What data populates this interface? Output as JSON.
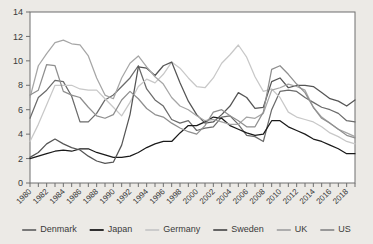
{
  "chart_data": {
    "type": "line",
    "title": "",
    "subtitle": "",
    "xlabel": "",
    "ylabel": "",
    "xlim": [
      1980,
      2019
    ],
    "ylim": [
      0,
      14
    ],
    "ytick_step": 2,
    "yticks": [
      0,
      2,
      4,
      6,
      8,
      10,
      12,
      14
    ],
    "xticks": [
      1980,
      1982,
      1984,
      1986,
      1988,
      1990,
      1992,
      1994,
      1996,
      1998,
      2000,
      2002,
      2004,
      2006,
      2008,
      2010,
      2012,
      2014,
      2016,
      2018
    ],
    "xtick_labels": [
      "1980",
      "1982",
      "1984",
      "1986",
      "1988",
      "1990",
      "1992",
      "1994",
      "1996",
      "1998",
      "2000",
      "2002",
      "2004",
      "2006",
      "2008",
      "2010",
      "2012",
      "2014",
      "2016",
      "2018"
    ],
    "x": [
      1980,
      1981,
      1982,
      1983,
      1984,
      1985,
      1986,
      1987,
      1988,
      1989,
      1990,
      1991,
      1992,
      1993,
      1994,
      1995,
      1996,
      1997,
      1998,
      1999,
      2000,
      2001,
      2002,
      2003,
      2004,
      2005,
      2006,
      2007,
      2008,
      2009,
      2010,
      2011,
      2012,
      2013,
      2014,
      2015,
      2016,
      2017,
      2018,
      2019
    ],
    "grid": true,
    "legend_position": "bottom",
    "series": [
      {
        "name": "Denmark",
        "color": "#6b6b6b",
        "values": [
          5.3,
          7.0,
          7.6,
          8.4,
          8.3,
          7.1,
          5.0,
          5.0,
          5.7,
          6.8,
          7.2,
          7.9,
          8.6,
          9.6,
          7.7,
          6.8,
          6.3,
          5.2,
          4.9,
          5.1,
          4.3,
          4.5,
          4.6,
          5.4,
          5.5,
          4.8,
          3.9,
          3.8,
          3.4,
          6.0,
          7.5,
          7.6,
          7.5,
          7.0,
          6.6,
          6.2,
          6.0,
          5.7,
          5.1,
          5.0
        ]
      },
      {
        "name": "Japan",
        "color": "#1a1a1a",
        "values": [
          2.0,
          2.2,
          2.4,
          2.6,
          2.7,
          2.6,
          2.8,
          2.8,
          2.5,
          2.3,
          2.1,
          2.1,
          2.2,
          2.5,
          2.9,
          3.2,
          3.4,
          3.4,
          4.1,
          4.7,
          4.7,
          5.0,
          5.4,
          5.3,
          4.7,
          4.4,
          4.1,
          3.9,
          4.0,
          5.1,
          5.1,
          4.6,
          4.3,
          4.0,
          3.6,
          3.4,
          3.1,
          2.8,
          2.4,
          2.4
        ]
      },
      {
        "name": "Germany",
        "color": "#c8c8c8",
        "values": [
          3.4,
          4.8,
          6.4,
          8.0,
          8.0,
          8.0,
          7.7,
          7.6,
          7.6,
          6.9,
          6.2,
          5.5,
          6.6,
          7.9,
          8.5,
          8.2,
          8.9,
          9.9,
          9.4,
          8.6,
          7.9,
          7.8,
          8.6,
          9.8,
          10.5,
          11.3,
          10.3,
          8.7,
          7.5,
          7.7,
          7.0,
          5.8,
          5.4,
          5.2,
          5.0,
          4.6,
          4.1,
          3.8,
          3.4,
          3.2
        ]
      },
      {
        "name": "Sweden",
        "color": "#555555",
        "values": [
          2.1,
          2.5,
          3.2,
          3.6,
          3.2,
          2.9,
          2.7,
          2.2,
          1.8,
          1.6,
          1.7,
          3.1,
          5.6,
          9.5,
          9.4,
          8.8,
          9.6,
          9.9,
          8.2,
          6.7,
          5.6,
          4.9,
          5.0,
          5.6,
          6.3,
          7.4,
          7.0,
          6.1,
          6.2,
          8.3,
          8.6,
          7.8,
          8.0,
          8.0,
          7.9,
          7.4,
          6.9,
          6.7,
          6.3,
          6.8
        ]
      },
      {
        "name": "UK",
        "color": "#a6a6a6",
        "values": [
          7.0,
          9.6,
          10.6,
          11.5,
          11.7,
          11.4,
          11.3,
          10.4,
          8.6,
          7.2,
          6.9,
          8.6,
          9.8,
          10.4,
          9.5,
          8.7,
          8.1,
          7.0,
          6.3,
          6.0,
          5.5,
          5.1,
          5.2,
          5.0,
          4.8,
          4.8,
          5.4,
          5.3,
          5.7,
          7.6,
          7.8,
          8.1,
          7.9,
          7.6,
          6.2,
          5.4,
          4.9,
          4.4,
          4.1,
          3.8
        ]
      },
      {
        "name": "US",
        "color": "#8f8f8f",
        "values": [
          7.2,
          7.6,
          9.7,
          9.6,
          7.5,
          7.2,
          7.0,
          6.2,
          5.5,
          5.3,
          5.6,
          6.8,
          7.5,
          6.9,
          6.1,
          5.6,
          5.4,
          4.9,
          4.5,
          4.2,
          4.0,
          4.7,
          5.8,
          6.0,
          5.5,
          5.1,
          4.6,
          4.6,
          5.8,
          9.3,
          9.6,
          8.9,
          8.1,
          7.4,
          6.2,
          5.3,
          4.9,
          4.4,
          3.9,
          3.7
        ]
      }
    ]
  },
  "legend": {
    "items": [
      {
        "label": "Denmark"
      },
      {
        "label": "Japan"
      },
      {
        "label": "Germany"
      },
      {
        "label": "Sweden"
      },
      {
        "label": "UK"
      },
      {
        "label": "US"
      }
    ]
  }
}
